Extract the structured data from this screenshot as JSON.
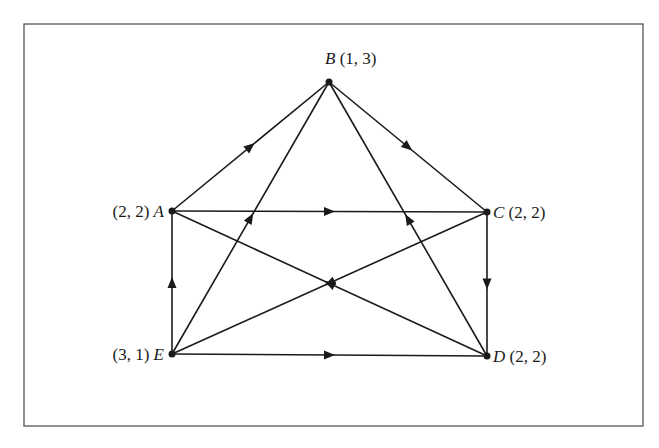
{
  "figure": {
    "border_color": "#555555",
    "line_color": "#1a1a1a",
    "nodes": [
      {
        "id": "A",
        "label": "A",
        "value": "(2, 2)",
        "x": 172,
        "y": 211,
        "label_side": "left"
      },
      {
        "id": "B",
        "label": "B",
        "value": "(1, 3)",
        "x": 329,
        "y": 82,
        "label_side": "top"
      },
      {
        "id": "C",
        "label": "C",
        "value": "(2, 2)",
        "x": 487,
        "y": 212,
        "label_side": "right"
      },
      {
        "id": "D",
        "label": "D",
        "value": "(2, 2)",
        "x": 487,
        "y": 356,
        "label_side": "right"
      },
      {
        "id": "E",
        "label": "E",
        "value": "(3, 1)",
        "x": 172,
        "y": 354,
        "label_side": "left"
      }
    ],
    "edges": [
      {
        "from": "A",
        "to": "B"
      },
      {
        "from": "E",
        "to": "B"
      },
      {
        "from": "D",
        "to": "B"
      },
      {
        "from": "B",
        "to": "C"
      },
      {
        "from": "A",
        "to": "C"
      },
      {
        "from": "D",
        "to": "A"
      },
      {
        "from": "C",
        "to": "E"
      },
      {
        "from": "E",
        "to": "A"
      },
      {
        "from": "C",
        "to": "D"
      },
      {
        "from": "E",
        "to": "D"
      }
    ]
  }
}
